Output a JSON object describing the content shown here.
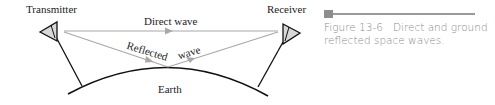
{
  "diagram": {
    "labels": {
      "transmitter": "Transmitter",
      "receiver": "Receiver",
      "direct_wave": "Direct wave",
      "reflected": "Reflected",
      "wave": "wave",
      "earth": "Earth"
    },
    "colors": {
      "wave_line": "#a8a8a8",
      "earth_line": "#111111",
      "antenna_fill": "#d8d8d8"
    }
  },
  "caption": {
    "figure_number": "Figure 13-6",
    "text": "Direct and ground reflected space waves."
  }
}
